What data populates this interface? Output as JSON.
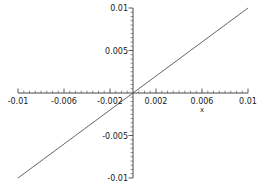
{
  "chart_data": {
    "type": "line",
    "title": "",
    "subtitle": "",
    "xlabel": "x",
    "ylabel": "",
    "xlim": [
      -0.01,
      0.01
    ],
    "ylim": [
      -0.01,
      0.01
    ],
    "grid": false,
    "legend": false,
    "legend_position": "none",
    "axes_style": "crossing-at-origin",
    "line_color": "#555555",
    "axis_color": "#333333",
    "background_color": "#ffffff",
    "x_ticks": [
      -0.01,
      -0.006,
      -0.002,
      0.002,
      0.006,
      0.01
    ],
    "x_tick_labels": [
      "-0.01",
      "-0.006",
      "-0.002",
      "0.002",
      "0.006",
      "0.01"
    ],
    "y_ticks": [
      -0.01,
      -0.005,
      0.005,
      0.01
    ],
    "y_tick_labels": [
      "-0.01",
      "-0.005",
      "0.005",
      "0.01"
    ],
    "x_minor_step": 0.0005,
    "y_minor_step": 0.0005,
    "series": [
      {
        "name": "y = x",
        "x": [
          -0.01,
          -0.005,
          0.0,
          0.005,
          0.01
        ],
        "values": [
          -0.01,
          -0.005,
          0.0,
          0.005,
          0.01
        ]
      }
    ]
  },
  "labels": {
    "x_axis_name": "x",
    "x_tick_0": "-0.01",
    "x_tick_1": "-0.006",
    "x_tick_2": "-0.002",
    "x_tick_3": "0.002",
    "x_tick_4": "0.006",
    "x_tick_5": "0.01",
    "y_tick_0": "0.01",
    "y_tick_1": "0.005",
    "y_tick_2": "-0.005",
    "y_tick_3": "-0.01"
  }
}
